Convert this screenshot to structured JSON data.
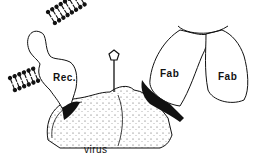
{
  "labels": {
    "receptor": "Rec.",
    "fab_left": "Fab",
    "fab_right": "Fab",
    "virus": "virus"
  },
  "colors": {
    "ink": "#111111",
    "background": "#ffffff"
  }
}
